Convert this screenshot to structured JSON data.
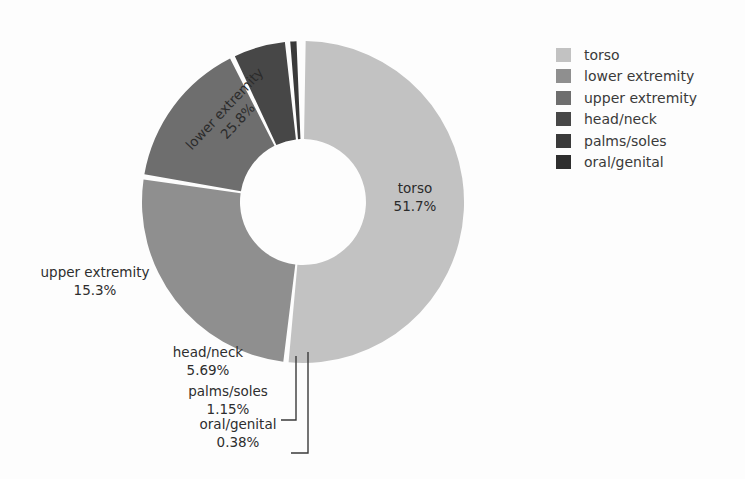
{
  "chart_data": {
    "type": "pie",
    "subtype": "donut",
    "title": "",
    "xlabel": "",
    "ylabel": "",
    "legend_position": "right",
    "grid": false,
    "units": "percent",
    "categories": [
      "torso",
      "lower extremity",
      "upper extremity",
      "head/neck",
      "palms/soles",
      "oral/genital"
    ],
    "values": [
      51.7,
      25.8,
      15.3,
      5.69,
      1.15,
      0.38
    ],
    "value_labels": [
      "51.7%",
      "25.8%",
      "15.3%",
      "5.69%",
      "1.15%",
      "0.38%"
    ],
    "colors": [
      "#c2c2c2",
      "#8f8f8f",
      "#6e6e6e",
      "#474747",
      "#3a3a3a",
      "#2e2e2e"
    ],
    "slices": [
      {
        "label": "torso",
        "value": 51.7,
        "value_label": "51.7%",
        "color": "#c2c2c2",
        "label_placement": "inside",
        "label_rotation": 0
      },
      {
        "label": "lower extremity",
        "value": 25.8,
        "value_label": "25.8%",
        "color": "#8f8f8f",
        "label_placement": "inside",
        "label_rotation": -47
      },
      {
        "label": "upper extremity",
        "value": 15.3,
        "value_label": "15.3%",
        "color": "#6e6e6e",
        "label_placement": "outside",
        "label_rotation": 0
      },
      {
        "label": "head/neck",
        "value": 5.69,
        "value_label": "5.69%",
        "color": "#474747",
        "label_placement": "outside",
        "label_rotation": 0
      },
      {
        "label": "palms/soles",
        "value": 1.15,
        "value_label": "1.15%",
        "color": "#3a3a3a",
        "label_placement": "outside-leader",
        "label_rotation": 0
      },
      {
        "label": "oral/genital",
        "value": 0.38,
        "value_label": "0.38%",
        "color": "#2e2e2e",
        "label_placement": "outside-leader",
        "label_rotation": 0
      }
    ]
  },
  "legend": {
    "items": [
      {
        "label": "torso",
        "color": "#c2c2c2"
      },
      {
        "label": "lower extremity",
        "color": "#8f8f8f"
      },
      {
        "label": "upper extremity",
        "color": "#6e6e6e"
      },
      {
        "label": "head/neck",
        "color": "#474747"
      },
      {
        "label": "palms/soles",
        "color": "#3a3a3a"
      },
      {
        "label": "oral/genital",
        "color": "#2e2e2e"
      }
    ]
  },
  "labels": {
    "torso_name": "torso",
    "torso_value": "51.7%",
    "lower_name": "lower extremity",
    "lower_value": "25.8%",
    "upper_name": "upper extremity",
    "upper_value": "15.3%",
    "head_name": "head/neck",
    "head_value": "5.69%",
    "palms_name": "palms/soles",
    "palms_value": "1.15%",
    "oral_name": "oral/genital",
    "oral_value": "0.38%"
  }
}
